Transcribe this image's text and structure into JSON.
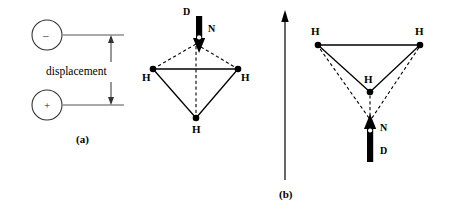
{
  "figure": {
    "width": 451,
    "height": 218,
    "background": "#ffffff",
    "stroke_color": "#000000"
  },
  "panel_a": {
    "label": "(a)",
    "dimension_label": "displacement",
    "negative_charge_symbol": "–",
    "positive_charge_symbol": "+",
    "charges": [
      {
        "sign_name": "negative-charge",
        "symbol": "–",
        "cx": 47,
        "cy": 35,
        "r": 15
      },
      {
        "sign_name": "positive-charge",
        "symbol": "+",
        "cx": 47,
        "cy": 105,
        "r": 15
      }
    ],
    "dimension_line": {
      "x": 111,
      "y_top": 35,
      "y_bottom": 105
    },
    "leader_lines": [
      {
        "x1": 63,
        "y1": 35,
        "x2": 124,
        "y2": 35
      },
      {
        "x1": 63,
        "y1": 105,
        "x2": 124,
        "y2": 105
      }
    ]
  },
  "molecule_up": {
    "caption_note": "NH3 with nitrogen above hydrogen plane",
    "nitrogen_label": "N",
    "dipole_label": "D",
    "hydrogen_labels": [
      "H",
      "H",
      "H"
    ],
    "nitrogen_position": {
      "x": 196,
      "y": 42
    },
    "hydrogens": [
      {
        "name": "hydrogen-left",
        "x": 153,
        "y": 69,
        "label": "H",
        "label_x": 146,
        "label_y": 73
      },
      {
        "name": "hydrogen-right",
        "x": 238,
        "y": 69,
        "label": "H",
        "label_x": 240,
        "label_y": 73
      },
      {
        "name": "hydrogen-front",
        "x": 196,
        "y": 118,
        "label": "H",
        "label_x": 192,
        "label_y": 126
      }
    ],
    "arrow": {
      "direction": "down",
      "x": 199,
      "y_tail": 17,
      "y_head": 52,
      "shaft_width": 6
    },
    "dipole_label_pos": {
      "x": 185,
      "y": 12
    },
    "nitrogen_label_pos": {
      "x": 209,
      "y": 27
    }
  },
  "transition_arrow": {
    "direction": "up",
    "x": 285,
    "y_tail": 180,
    "y_head": 11
  },
  "panel_b": {
    "label": "(b)",
    "label_pos": {
      "x": 281,
      "y": 191
    },
    "caption_note": "NH3 inverted, nitrogen below hydrogen plane",
    "nitrogen_label": "N",
    "dipole_label": "D",
    "hydrogen_labels": [
      "H",
      "H",
      "H"
    ],
    "nitrogen_position": {
      "x": 370,
      "y": 122
    },
    "hydrogens": [
      {
        "name": "hydrogen-left",
        "x": 318,
        "y": 45,
        "label": "H",
        "label_x": 312,
        "label_y": 30
      },
      {
        "name": "hydrogen-right",
        "x": 420,
        "y": 45,
        "label": "H",
        "label_x": 417,
        "label_y": 30
      },
      {
        "name": "hydrogen-front",
        "x": 370,
        "y": 92,
        "label": "H",
        "label_x": 365,
        "label_y": 78
      }
    ],
    "arrow": {
      "direction": "up",
      "x": 370,
      "y_tail": 162,
      "y_head": 116,
      "shaft_width": 6
    },
    "dipole_label_pos": {
      "x": 379,
      "y": 150
    },
    "nitrogen_label_pos": {
      "x": 381,
      "y": 126
    }
  }
}
